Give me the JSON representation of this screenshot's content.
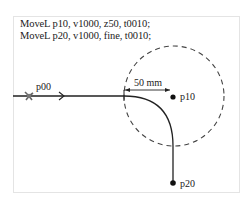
{
  "code": {
    "lines": [
      "MoveL p10, v1000, z50, t0010;",
      "MoveL p20, v1000, fine, t0010;"
    ]
  },
  "diagram": {
    "points": {
      "start": "p00",
      "corner": "p10",
      "end": "p20"
    },
    "zone_label": "50 mm",
    "colors": {
      "path": "#222222",
      "zone_circle": "#444444",
      "frame_border": "#e4e4e4"
    }
  }
}
